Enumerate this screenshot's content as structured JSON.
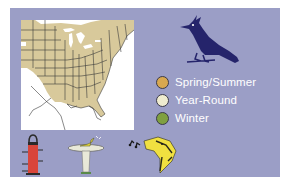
{
  "panel": {
    "background_color": "#9b9ec6"
  },
  "map": {
    "description": "Range map of eastern North America",
    "range_color": "#d8c99b",
    "border_color": "#3a3a3a",
    "water_color": "#ffffff"
  },
  "bird": {
    "icon": "blue-jay-silhouette-icon",
    "color": "#25246b"
  },
  "legend": {
    "items": [
      {
        "label": "Spring/Summer",
        "color": "#d8a850"
      },
      {
        "label": "Year-Round",
        "color": "#efeccf"
      },
      {
        "label": "Winter",
        "color": "#7fa040"
      }
    ]
  },
  "habits": {
    "items": [
      {
        "icon": "bird-feeder-icon",
        "color": "#d9453a"
      },
      {
        "icon": "bird-bath-icon",
        "color": "#e8e8d8"
      },
      {
        "icon": "bird-song-icon",
        "color": "#f0e040"
      }
    ]
  }
}
